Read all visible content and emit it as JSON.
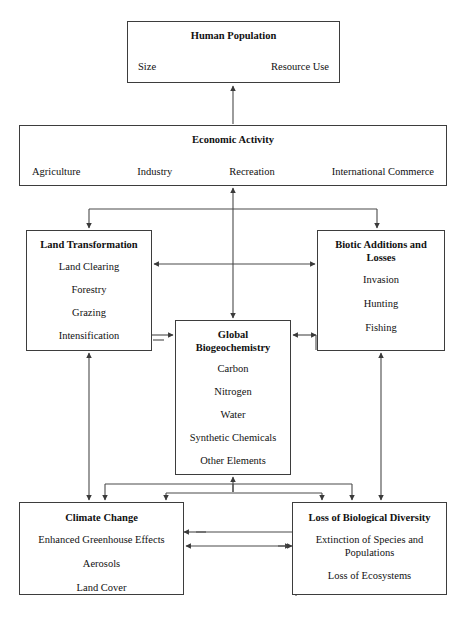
{
  "page": {
    "corner_mark": "",
    "diagram_title": "Human Dominated Ecosystems Conceptual Flow Diagram"
  },
  "nodes": {
    "human_population": {
      "title": "Human Population",
      "left_item": "Size",
      "right_item": "Resource Use"
    },
    "economic_activity": {
      "title": "Economic Activity",
      "items": [
        "Agriculture",
        "Industry",
        "Recreation",
        "International Commerce"
      ]
    },
    "land_transformation": {
      "title": "Land Transformation",
      "items": [
        "Land Clearing",
        "Forestry",
        "Grazing",
        "Intensification"
      ]
    },
    "biotic_additions": {
      "title": "Biotic Additions and Losses",
      "items": [
        "Invasion",
        "Hunting",
        "Fishing"
      ]
    },
    "global_biogeochemistry": {
      "title": "Global Biogeochemistry",
      "items": [
        "Carbon",
        "Nitrogen",
        "Water",
        "Synthetic Chemicals",
        "Other Elements"
      ]
    },
    "climate_change": {
      "title": "Climate Change",
      "items": [
        "Enhanced Greenhouse Effects",
        "Aerosols",
        "Land Cover"
      ]
    },
    "loss_of_biological_diversity": {
      "title": "Loss of Biological Diversity",
      "items": [
        "Extinction of Species and Populations",
        "Loss of Ecosystems"
      ]
    }
  },
  "connections": [
    {
      "from": "economic_activity",
      "to": "human_population",
      "style": "single-arrow-up"
    },
    {
      "from": "economic_activity",
      "to": "land_transformation",
      "style": "single-arrow-down"
    },
    {
      "from": "economic_activity",
      "to": "biotic_additions",
      "style": "single-arrow-down"
    },
    {
      "from": "economic_activity",
      "to": "global_biogeochemistry",
      "style": "double-arrow-vertical"
    },
    {
      "from": "land_transformation",
      "to": "biotic_additions",
      "style": "double-arrow-horizontal"
    },
    {
      "from": "land_transformation",
      "to": "global_biogeochemistry",
      "style": "single-arrow-right"
    },
    {
      "from": "global_biogeochemistry",
      "to": "biotic_additions",
      "style": "double-arrow-horizontal"
    },
    {
      "from": "land_transformation",
      "to": "climate_change",
      "style": "double-arrow-vertical"
    },
    {
      "from": "biotic_additions",
      "to": "loss_of_biological_diversity",
      "style": "double-arrow-vertical"
    },
    {
      "from": "global_biogeochemistry",
      "to": "climate_change",
      "style": "single-arrow-down"
    },
    {
      "from": "global_biogeochemistry",
      "to": "loss_of_biological_diversity",
      "style": "single-arrow-down"
    },
    {
      "from": "climate_change",
      "to": "loss_of_biological_diversity",
      "style": "double-arrow-horizontal"
    },
    {
      "from": "climate_change",
      "to": "global_biogeochemistry",
      "style": "single-arrow-up"
    },
    {
      "from": "loss_of_biological_diversity",
      "to": "climate_change",
      "style": "single-arrow-left"
    }
  ],
  "colors": {
    "box_border": "#3d3d3d",
    "connector": "#4a4a4a",
    "background": "#ffffff",
    "text": "#111111"
  }
}
